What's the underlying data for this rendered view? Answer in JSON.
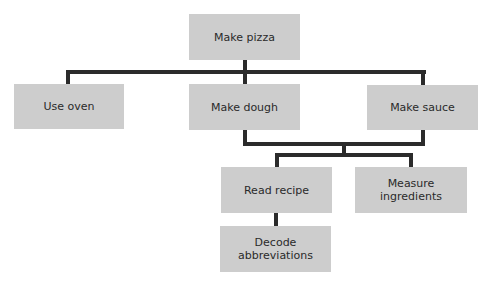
{
  "diagram": {
    "type": "tree",
    "colors": {
      "box": "#cdcdcd",
      "line": "#2b2b2b",
      "text": "#2a2a2a"
    },
    "nodes": {
      "root": "Make pizza",
      "use_oven": "Use oven",
      "make_dough": "Make dough",
      "make_sauce": "Make sauce",
      "read_recipe": "Read recipe",
      "measure_ingredients": "Measure ingredients",
      "decode_abbreviations": "Decode abbreviations"
    },
    "edges": [
      [
        "Make pizza",
        "Use oven"
      ],
      [
        "Make pizza",
        "Make dough"
      ],
      [
        "Make pizza",
        "Make sauce"
      ],
      [
        "Make dough + Make sauce",
        "Read recipe"
      ],
      [
        "Make dough + Make sauce",
        "Measure ingredients"
      ],
      [
        "Read recipe",
        "Decode abbreviations"
      ]
    ]
  }
}
